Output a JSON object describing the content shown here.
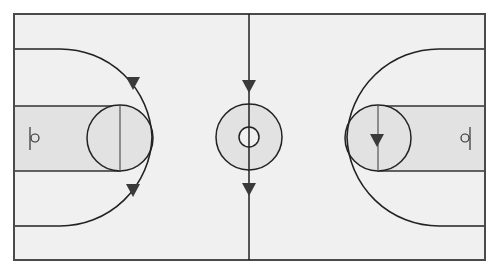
{
  "diagram": {
    "title": "Basketball court play diagram",
    "colors": {
      "background": "#ffffff",
      "court_floor": "#f0f0f0",
      "key_fill": "#e2e2e2",
      "line": "#222222",
      "border": "#4a4a4a",
      "arrow": "#3a3a3a"
    },
    "court": {
      "x": 14,
      "y": 14,
      "width": 471,
      "height": 246
    },
    "center": {
      "x": 249,
      "y": 137,
      "outer_radius": 33,
      "inner_radius": 10
    },
    "left_side": {
      "key": {
        "x": 14,
        "y": 106,
        "width": 106,
        "height": 65
      },
      "free_throw_circle": {
        "cx": 120,
        "cy": 138,
        "r": 33
      },
      "basket": {
        "cx": 36,
        "cy": 138,
        "r": 4,
        "backboard_x": 30
      },
      "three_point_arc": "M14,49 L60,49 A92,92 0 0 1 152,137 A92,92 0 0 1 60,226 L14,226"
    },
    "right_side": {
      "key": {
        "x": 378,
        "y": 106,
        "width": 107,
        "height": 65
      },
      "free_throw_circle": {
        "cx": 378,
        "cy": 138,
        "r": 33
      },
      "basket": {
        "cx": 464,
        "cy": 138,
        "r": 4,
        "backboard_x": 470
      },
      "three_point_arc": "M485,49 L439,49 A92,92 0 0 0 347,137 A92,92 0 0 0 439,226 L485,226"
    },
    "arrows": [
      {
        "id": "left-top",
        "x": 133,
        "y": 83,
        "direction": "down"
      },
      {
        "id": "left-bottom",
        "x": 133,
        "y": 190,
        "direction": "down"
      },
      {
        "id": "center-top",
        "x": 249,
        "y": 86,
        "direction": "down"
      },
      {
        "id": "center-bottom",
        "x": 249,
        "y": 189,
        "direction": "down"
      },
      {
        "id": "right-key",
        "x": 377,
        "y": 140,
        "direction": "down"
      }
    ]
  }
}
